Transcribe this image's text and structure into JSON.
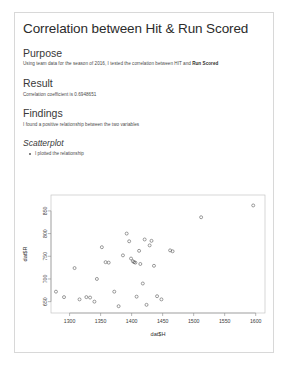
{
  "document": {
    "title": "Correlation between Hit & Run Scored",
    "sections": [
      {
        "heading": "Purpose",
        "level": "h2",
        "body_prefix": "Using team data for the season of 2016, I tested the correlation between HIT and ",
        "body_strong": "Run Scored"
      },
      {
        "heading": "Result",
        "level": "h2",
        "body": "Correlation coefficient is 0.6948651"
      },
      {
        "heading": "Findings",
        "level": "h2",
        "body": "I found a positive relationship between the two variables"
      },
      {
        "heading": "Scatterplot",
        "level": "h3",
        "bullets": [
          "I plotted the relationship"
        ]
      }
    ]
  },
  "chart_data": {
    "type": "scatter",
    "title": "",
    "xlabel": "dat$H",
    "ylabel": "dat$R",
    "xlim": [
      1270,
      1615
    ],
    "ylim": [
      625,
      885
    ],
    "xticks": [
      1300,
      1350,
      1400,
      1450,
      1500,
      1550,
      1600
    ],
    "yticks": [
      650,
      700,
      750,
      800,
      850
    ],
    "grid": false,
    "legend": "none",
    "point_symbol": "open-circle",
    "points": [
      [
        1278,
        672
      ],
      [
        1291,
        660
      ],
      [
        1308,
        724
      ],
      [
        1316,
        655
      ],
      [
        1327,
        660
      ],
      [
        1333,
        659
      ],
      [
        1340,
        650
      ],
      [
        1344,
        700
      ],
      [
        1352,
        770
      ],
      [
        1358,
        737
      ],
      [
        1363,
        736
      ],
      [
        1372,
        672
      ],
      [
        1379,
        640
      ],
      [
        1386,
        752
      ],
      [
        1392,
        800
      ],
      [
        1396,
        783
      ],
      [
        1399,
        745
      ],
      [
        1402,
        739
      ],
      [
        1404,
        737
      ],
      [
        1406,
        736
      ],
      [
        1408,
        661
      ],
      [
        1412,
        762
      ],
      [
        1414,
        733
      ],
      [
        1418,
        690
      ],
      [
        1421,
        787
      ],
      [
        1424,
        643
      ],
      [
        1429,
        774
      ],
      [
        1432,
        784
      ],
      [
        1436,
        729
      ],
      [
        1441,
        662
      ],
      [
        1448,
        655
      ],
      [
        1462,
        763
      ],
      [
        1466,
        761
      ],
      [
        1512,
        836
      ],
      [
        1596,
        862
      ]
    ]
  }
}
